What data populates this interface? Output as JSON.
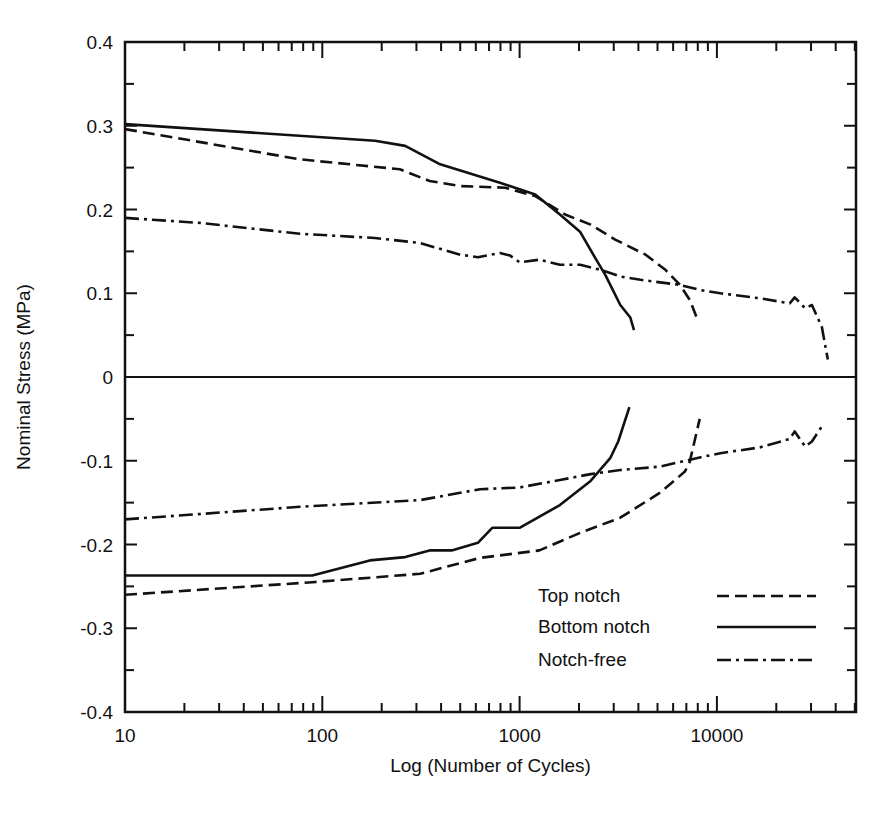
{
  "chart_data": {
    "type": "line",
    "title": "",
    "xlabel": "Log (Number of Cycles)",
    "ylabel": "Nominal Stress (MPa)",
    "xscale": "log",
    "xlim": [
      10,
      50700
    ],
    "ylim": [
      -0.4,
      0.4
    ],
    "grid": false,
    "x_ticks": [
      10,
      100,
      1000,
      10000
    ],
    "x_tick_labels": [
      "10",
      "100",
      "1000",
      "10000"
    ],
    "y_ticks": [
      -0.4,
      -0.3,
      -0.2,
      -0.1,
      0,
      0.1,
      0.2,
      0.3,
      0.4
    ],
    "y_tick_labels": [
      "-0.4",
      "-0.3",
      "-0.2",
      "-0.1",
      "0",
      "0.1",
      "0.2",
      "0.3",
      "0.4"
    ],
    "legend_position": "bottom-right",
    "legend": [
      {
        "label": "Top notch",
        "style": "dashed"
      },
      {
        "label": "Bottom notch",
        "style": "solid"
      },
      {
        "label": "Notch-free",
        "style": "dash-dot"
      }
    ],
    "series": [
      {
        "name": "Top notch (tension)",
        "style": "dashed",
        "x": [
          10,
          77,
          247,
          350,
          500,
          843,
          1200,
          1700,
          2290,
          3050,
          4350,
          5480,
          6500,
          7290,
          7900
        ],
        "y": [
          0.296,
          0.26,
          0.248,
          0.234,
          0.228,
          0.226,
          0.216,
          0.194,
          0.182,
          0.164,
          0.146,
          0.128,
          0.11,
          0.092,
          0.071
        ]
      },
      {
        "name": "Bottom notch (tension)",
        "style": "solid",
        "x": [
          10,
          185,
          263,
          396,
          795,
          1200,
          1600,
          2030,
          2420,
          2720,
          3240,
          3640,
          3800
        ],
        "y": [
          0.302,
          0.282,
          0.276,
          0.254,
          0.232,
          0.218,
          0.194,
          0.173,
          0.142,
          0.122,
          0.086,
          0.071,
          0.056
        ]
      },
      {
        "name": "Notch-free (tension)",
        "style": "dash-dot",
        "x": [
          10,
          24,
          77,
          185,
          313,
          500,
          615,
          795,
          895,
          1000,
          1260,
          1600,
          2030,
          2570,
          3240,
          4100,
          5160,
          6500,
          8180,
          10400,
          16500,
          23400,
          24800,
          28000,
          30300,
          34000,
          36500
        ],
        "y": [
          0.19,
          0.184,
          0.171,
          0.166,
          0.16,
          0.146,
          0.143,
          0.148,
          0.145,
          0.137,
          0.14,
          0.134,
          0.134,
          0.128,
          0.12,
          0.116,
          0.113,
          0.11,
          0.104,
          0.1,
          0.094,
          0.088,
          0.095,
          0.082,
          0.086,
          0.06,
          0.021
        ]
      },
      {
        "name": "Top notch (compression)",
        "style": "dashed",
        "x": [
          10,
          89,
          313,
          630,
          1260,
          2030,
          3240,
          5160,
          6880,
          7290,
          8180
        ],
        "y": [
          -0.26,
          -0.245,
          -0.235,
          -0.216,
          -0.207,
          -0.186,
          -0.168,
          -0.138,
          -0.113,
          -0.101,
          -0.05
        ]
      },
      {
        "name": "Bottom notch (compression)",
        "style": "solid",
        "x": [
          10,
          89,
          174,
          263,
          350,
          453,
          615,
          726,
          895,
          1000,
          1600,
          2290,
          2880,
          3160,
          3600
        ],
        "y": [
          -0.237,
          -0.237,
          -0.219,
          -0.215,
          -0.207,
          -0.207,
          -0.198,
          -0.18,
          -0.18,
          -0.18,
          -0.153,
          -0.124,
          -0.097,
          -0.077,
          -0.036
        ]
      },
      {
        "name": "Notch-free (compression)",
        "style": "dash-dot",
        "x": [
          10,
          77,
          313,
          630,
          1000,
          1600,
          2290,
          3240,
          5160,
          8180,
          10400,
          16500,
          23400,
          24800,
          28000,
          30300,
          34000
        ],
        "y": [
          -0.17,
          -0.155,
          -0.147,
          -0.134,
          -0.132,
          -0.123,
          -0.116,
          -0.111,
          -0.107,
          -0.096,
          -0.091,
          -0.084,
          -0.074,
          -0.065,
          -0.083,
          -0.077,
          -0.059
        ]
      }
    ]
  }
}
